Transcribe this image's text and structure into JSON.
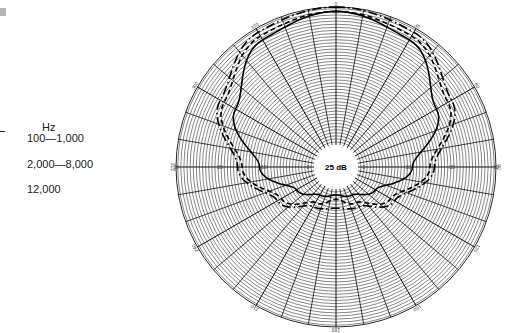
{
  "chart_data": {
    "type": "polar",
    "title": "",
    "center_label": "25 dB",
    "radial_axis": {
      "tick_labels": [
        "0",
        "10",
        "20",
        "30"
      ],
      "unit": "dB",
      "dense_rings": true
    },
    "angular_axis": {
      "tick_labels": [
        "0",
        "30",
        "60",
        "90",
        "120",
        "150",
        "180",
        "210",
        "240",
        "270",
        "300",
        "330"
      ],
      "spoke_spacing_deg": 10,
      "direction": "clockwise",
      "zero_at": "top"
    },
    "legend": {
      "title": "Hz",
      "position": "left",
      "entries": [
        {
          "label": "100—1,000",
          "style": "dash-dot"
        },
        {
          "label": "2,000—8,000",
          "style": "dashed"
        },
        {
          "label": "12,000",
          "style": "solid"
        }
      ]
    },
    "series": [
      {
        "name": "100—1,000",
        "style": "dash-dot",
        "angles_deg": [
          0,
          30,
          60,
          90,
          120,
          150,
          180,
          210,
          240,
          270,
          300,
          330
        ],
        "values": [
          30,
          29,
          24,
          16,
          9,
          4,
          3,
          4,
          9,
          16,
          24,
          29
        ]
      },
      {
        "name": "2,000—8,000",
        "style": "dashed",
        "angles_deg": [
          0,
          30,
          60,
          90,
          120,
          150,
          180,
          210,
          240,
          270,
          300,
          330
        ],
        "values": [
          29,
          28,
          23,
          15,
          8,
          3,
          1,
          3,
          8,
          15,
          23,
          28
        ]
      },
      {
        "name": "12,000",
        "style": "solid",
        "angles_deg": [
          0,
          30,
          60,
          90,
          120,
          150,
          180,
          210,
          240,
          270,
          300,
          330
        ],
        "values": [
          29,
          27,
          20,
          11,
          4,
          1,
          0,
          1,
          4,
          11,
          20,
          27
        ]
      }
    ]
  },
  "legend": {
    "title": "Hz",
    "rows": [
      "100—1,000",
      "2,000—8,000",
      "12,000"
    ]
  },
  "center_label": "25 dB"
}
